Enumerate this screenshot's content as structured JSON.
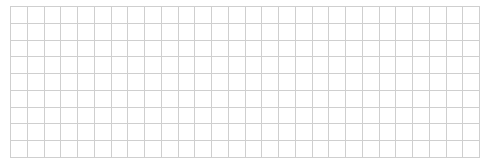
{
  "canvas": {
    "width": 500,
    "height": 168,
    "background": "#ffffff"
  },
  "grid": {
    "line_color": "#cfcfcf",
    "line_width": 1,
    "x_start": 10,
    "x_end": 479,
    "y_start": 6,
    "y_end": 157,
    "vertical_lines": 29,
    "horizontal_lines": 10
  }
}
